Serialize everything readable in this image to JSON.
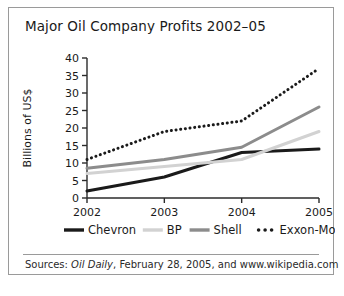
{
  "figure": {
    "title": "Major Oil Company Profits 2002–05",
    "source_prefix": "Sources: ",
    "source_italic": "Oil Daily",
    "source_rest": ", February 28, 2005, and www.wikipedia.com",
    "border_color": "#9a9a9a",
    "background": "#ffffff"
  },
  "chart_data": {
    "type": "line",
    "title": "Major Oil Company Profits 2002–05",
    "xlabel": "",
    "ylabel": "Billions of US$",
    "categories": [
      "2002",
      "2003",
      "2004",
      "2005"
    ],
    "x": [
      2002,
      2003,
      2004,
      2005
    ],
    "ylim": [
      0,
      40
    ],
    "yticks": [
      0,
      5,
      10,
      15,
      20,
      25,
      30,
      35,
      40
    ],
    "ytick_labels": [
      "0",
      "5",
      "10",
      "15",
      "20",
      "25",
      "30",
      "35",
      "40"
    ],
    "grid": false,
    "legend_position": "bottom",
    "series": [
      {
        "name": "Chevron",
        "values": [
          2,
          6,
          13,
          14
        ],
        "color": "#1a1a1a",
        "width": 3,
        "dash": "none"
      },
      {
        "name": "BP",
        "values": [
          7,
          9,
          11,
          19
        ],
        "color": "#d2d2d2",
        "width": 3,
        "dash": "none"
      },
      {
        "name": "Shell",
        "values": [
          8.5,
          11,
          14.5,
          26
        ],
        "color": "#8c8c8c",
        "width": 3,
        "dash": "none"
      },
      {
        "name": "Exxon-Mobil",
        "values": [
          11,
          19,
          22,
          37
        ],
        "color": "#1a1a1a",
        "width": 3,
        "dash": "dotted"
      }
    ]
  }
}
